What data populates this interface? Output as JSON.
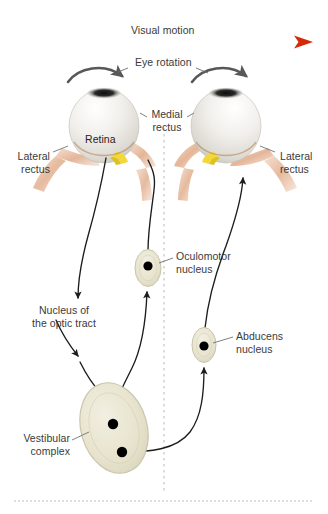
{
  "figure": {
    "background_color": "#ffffff"
  },
  "colors": {
    "arrow_red": "#d62b0a",
    "arrow_red_light": "#f7cfc0",
    "label_text": "#3a3a3a",
    "pathway_line": "#1c1c1c",
    "nucleus_fill": "#e8e4cf",
    "nucleus_stroke": "#c9c5ad",
    "nucleus_dot": "#000000",
    "sclera_light": "#f4f3f0",
    "sclera_shade": "#cfcdc6",
    "retina_tan": "#c08a56",
    "retina_dark": "#8a5a2b",
    "optic_nerve_yellow": "#f2d83a",
    "muscle_pink": "#e8bfa6",
    "midline_gray": "#b8b8b8",
    "rotation_arrow": "#58585a"
  },
  "visual_motion": {
    "label": "Visual motion",
    "direction": "left-to-right",
    "arrow_start_x": 18,
    "arrow_end_x": 312,
    "arrow_y": 42
  },
  "eye_rotation": {
    "label": "Eye rotation",
    "direction": "left-to-right (both eyes)"
  },
  "labels": {
    "retina": "Retina",
    "medial_rectus": "Medial\nrectus",
    "lateral_rectus_left": "Lateral\nrectus",
    "lateral_rectus_right": "Lateral\nrectus",
    "nucleus_optic_tract": "Nucleus of\nthe optic tract",
    "oculomotor_nucleus": "Oculomotor\nnucleus",
    "abducens_nucleus": "Abducens\nnucleus",
    "vestibular_complex": "Vestibular\ncomplex"
  },
  "structures": [
    {
      "name": "left-eye",
      "type": "eyeball",
      "cx": 104,
      "cy": 126
    },
    {
      "name": "right-eye",
      "type": "eyeball",
      "cx": 226,
      "cy": 126
    },
    {
      "name": "oculomotor-nucleus",
      "type": "nucleus",
      "cx": 148,
      "cy": 268,
      "rx": 13,
      "ry": 18,
      "dots": 1
    },
    {
      "name": "abducens-nucleus",
      "type": "nucleus",
      "cx": 204,
      "cy": 345,
      "rx": 12,
      "ry": 17,
      "dots": 1
    },
    {
      "name": "vestibular-complex",
      "type": "nucleus",
      "cx": 114,
      "cy": 428,
      "rx": 33,
      "ry": 46,
      "dots": 2
    }
  ],
  "midline": {
    "name": "body-midline",
    "style": "dashed",
    "x": 164,
    "y_top": 128,
    "y_bottom": 492
  }
}
